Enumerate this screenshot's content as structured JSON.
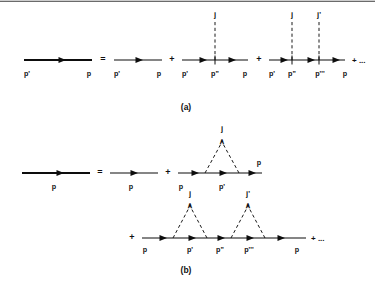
{
  "figure": {
    "caption_a": "(a)",
    "caption_b": "(b)",
    "equals_sign": "=",
    "plus_sign": "+",
    "ellipsis": "+ ...",
    "momentum": {
      "p": "p",
      "p_prime": "p'",
      "p_double_prime": "p\"",
      "p_triple_prime": "p'''"
    },
    "source": {
      "j": "j",
      "j_prime": "j'"
    },
    "caret_marker": "∧"
  },
  "panel_a": {
    "label": "(a)",
    "lhs": {
      "name": "dressed-propagator",
      "labels": {
        "left": "p'",
        "right": "p"
      }
    },
    "terms": [
      {
        "name": "free-propagator-term",
        "operator": "=",
        "labels": {
          "left": "p'",
          "right": "p"
        },
        "vertices": []
      },
      {
        "name": "one-vertex-term",
        "operator": "+",
        "labels": {
          "left": "p'",
          "middle": "p\"",
          "right": "p"
        },
        "vertices": [
          {
            "source": "j",
            "momentum": "p\""
          }
        ]
      },
      {
        "name": "two-vertex-term",
        "operator": "+",
        "labels": {
          "left": "p'",
          "mid1": "p\"",
          "mid2": "p'''",
          "right": "p"
        },
        "vertices": [
          {
            "source": "j",
            "momentum": "p\""
          },
          {
            "source": "j'",
            "momentum": "p'''"
          }
        ],
        "trailing": "+ ..."
      }
    ]
  },
  "panel_b": {
    "label": "(b)",
    "lhs": {
      "name": "dressed-propagator",
      "labels": {
        "center": "p"
      }
    },
    "row1_terms": [
      {
        "name": "free-propagator-term",
        "operator": "=",
        "labels": {
          "center": "p"
        },
        "loops": []
      },
      {
        "name": "one-loop-term",
        "operator": "+",
        "labels": {
          "left": "p",
          "middle": "p'",
          "right": "p"
        },
        "loops": [
          {
            "source": "j",
            "marker": "∧"
          }
        ]
      }
    ],
    "row2_terms": [
      {
        "name": "two-loop-term",
        "operator": "+",
        "labels": {
          "left": "p",
          "mid1": "p'",
          "mid2": "p\"",
          "mid3": "p'''",
          "right": "p"
        },
        "loops": [
          {
            "source": "j",
            "marker": "∧"
          },
          {
            "source": "j'",
            "marker": "∧"
          }
        ],
        "trailing": "+ ..."
      }
    ]
  },
  "colors": {
    "ink": "#0d0d0d",
    "rule": "#3a3a3a",
    "background": "#ffffff"
  }
}
